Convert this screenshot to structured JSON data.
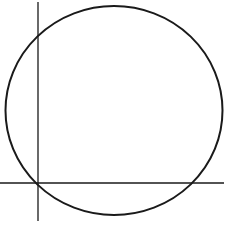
{
  "diagram": {
    "colors": {
      "stroke": "#1a1a1a",
      "background": "#ffffff"
    },
    "circle": {
      "cx": 114,
      "cy": 110.5,
      "rx": 108.5,
      "ry": 104.5
    },
    "vertical_line": {
      "x": 38,
      "y1": 2,
      "y2": 221
    },
    "horizontal_line": {
      "y": 183,
      "x1": 0,
      "x2": 224
    }
  }
}
